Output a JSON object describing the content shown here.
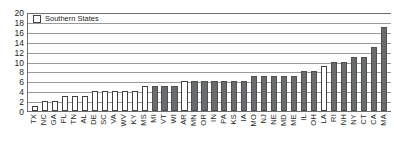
{
  "legend": {
    "label": "Southern States",
    "swatch": "legend-swatch-southern",
    "southern_color": "#ffffff",
    "other_color": "#6a6b6d"
  },
  "chart_data": {
    "type": "bar",
    "title": "",
    "xlabel": "",
    "ylabel": "",
    "ylim": [
      0,
      20
    ],
    "yticks": [
      0,
      2,
      4,
      6,
      8,
      10,
      12,
      14,
      16,
      18,
      20
    ],
    "grid": true,
    "legend_position": "top-left",
    "categories": [
      "TX",
      "NC",
      "GA",
      "FL",
      "TN",
      "AL",
      "DE",
      "SC",
      "VA",
      "WV",
      "KY",
      "MS",
      "MI",
      "VT",
      "WI",
      "AR",
      "MN",
      "OR",
      "IN",
      "PA",
      "KS",
      "IA",
      "MO",
      "NJ",
      "NE",
      "MD",
      "ME",
      "IL",
      "OH",
      "LA",
      "RI",
      "NH",
      "NY",
      "CT",
      "CA",
      "MA"
    ],
    "values": [
      1,
      2,
      2,
      3,
      3,
      3,
      4,
      4,
      4,
      4,
      4,
      5,
      5,
      5,
      5,
      6,
      6,
      6,
      6,
      6,
      6,
      6,
      7,
      7,
      7,
      7,
      7,
      8,
      8,
      9,
      10,
      10,
      11,
      11,
      13,
      17
    ],
    "groups": [
      "southern",
      "southern",
      "southern",
      "southern",
      "southern",
      "southern",
      "southern",
      "southern",
      "southern",
      "southern",
      "southern",
      "southern",
      "other",
      "other",
      "other",
      "southern",
      "other",
      "other",
      "other",
      "other",
      "other",
      "other",
      "other",
      "other",
      "other",
      "other",
      "other",
      "other",
      "other",
      "southern",
      "other",
      "other",
      "other",
      "other",
      "other",
      "other"
    ],
    "series": [
      {
        "name": "Southern States",
        "color": "#ffffff"
      },
      {
        "name": "Other States",
        "color": "#6a6b6d"
      }
    ]
  }
}
